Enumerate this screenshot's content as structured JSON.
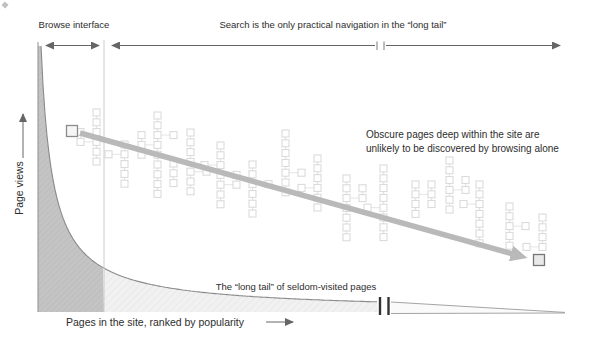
{
  "labels": {
    "browse": "Browse interface",
    "search": "Search is the only practical navigation in the “long tail”",
    "obscure_line1": "Obscure pages deep within the site are",
    "obscure_line2": "unlikely to be discovered by browsing alone",
    "long_tail": "The “long tail” of seldom-visited pages",
    "x_axis": "Pages in the site, ranked by popularity",
    "y_axis": "Page views"
  },
  "colors": {
    "head_fill": "#c4c4c4",
    "head_hatch": "#b8b8b8",
    "tail_fill": "#f1f1f1",
    "tail_hatch": "#e4e4e4",
    "curve_stroke": "#8a8a8a",
    "big_arrow": "#b9b9b9",
    "thin_arrow": "#666666",
    "tree_stroke": "#d8d8d8",
    "tree_line": "#e2e2e2",
    "square_stroke": "#8c8c8c",
    "text": "#2d2d2d"
  },
  "geometry": {
    "curve": {
      "x0": 30,
      "k": 2570,
      "p": 0.946,
      "base": 312,
      "xStart": 41,
      "xSplit": 104,
      "xEnd": 378
    },
    "wedge": {
      "x1": 391,
      "y_top": 302,
      "y_bottom": 313.5,
      "x2": 565,
      "y_tip": 312.4
    },
    "big_arrow": {
      "x1": 80,
      "y1": 133,
      "x2": 513,
      "y2": 254
    },
    "start_square": {
      "x": 66.5,
      "y": 125.5,
      "size": 11
    },
    "end_square": {
      "x": 533.5,
      "y": 254.5,
      "size": 11
    },
    "tree_square": 7,
    "tree_pitch": 9.8,
    "trees": [
      {
        "x": 93,
        "y": 109,
        "n": 6,
        "branches": [
          {
            "side": -1,
            "at": 3,
            "n": 2
          }
        ]
      },
      {
        "x": 121,
        "y": 141,
        "n": 5,
        "branches": [
          {
            "side": -1,
            "at": 1,
            "n": 1
          }
        ]
      },
      {
        "x": 154,
        "y": 112,
        "n": 9,
        "branches": [
          {
            "side": -1,
            "at": 3,
            "n": 3
          },
          {
            "side": 1,
            "at": 2,
            "n": 1
          }
        ]
      },
      {
        "x": 187,
        "y": 129,
        "n": 7,
        "branches": [
          {
            "side": 1,
            "at": 4,
            "n": 1
          }
        ]
      },
      {
        "x": 170,
        "y": 160,
        "n": 3,
        "branches": []
      },
      {
        "x": 217,
        "y": 142,
        "n": 7,
        "branches": [
          {
            "side": -1,
            "at": 2,
            "n": 1
          },
          {
            "side": 1,
            "at": 4,
            "n": 2
          }
        ]
      },
      {
        "x": 249,
        "y": 161,
        "n": 6,
        "branches": [
          {
            "side": 1,
            "at": 2,
            "n": 1
          }
        ]
      },
      {
        "x": 282,
        "y": 130,
        "n": 7,
        "branches": [
          {
            "side": 1,
            "at": 4,
            "n": 1
          }
        ]
      },
      {
        "x": 314,
        "y": 155,
        "n": 6,
        "branches": [
          {
            "side": -1,
            "at": 3,
            "n": 1
          }
        ]
      },
      {
        "x": 343,
        "y": 175,
        "n": 7,
        "branches": [
          {
            "side": 1,
            "at": 2,
            "n": 2
          }
        ]
      },
      {
        "x": 380,
        "y": 165,
        "n": 8,
        "branches": [
          {
            "side": -1,
            "at": 4,
            "n": 1
          }
        ]
      },
      {
        "x": 412,
        "y": 181,
        "n": 4,
        "branches": [
          {
            "side": 1,
            "at": 1,
            "n": 3
          }
        ]
      },
      {
        "x": 446,
        "y": 157,
        "n": 6,
        "branches": [
          {
            "side": 1,
            "at": 3,
            "n": 2
          }
        ]
      },
      {
        "x": 476,
        "y": 181,
        "n": 7,
        "branches": [
          {
            "side": -1,
            "at": 2,
            "n": 1
          }
        ]
      },
      {
        "x": 506,
        "y": 203,
        "n": 5,
        "branches": [
          {
            "side": 1,
            "at": 2,
            "n": 1
          }
        ]
      },
      {
        "x": 539,
        "y": 214,
        "n": 4,
        "branches": [
          {
            "side": -1,
            "at": 3,
            "n": 1
          }
        ]
      }
    ]
  },
  "chart_data": {
    "type": "area",
    "title": "",
    "xlabel": "Pages in the site, ranked by popularity",
    "ylabel": "Page views",
    "grid": false,
    "legend": false,
    "axis_break_x_px": 384,
    "series": [
      {
        "name": "Page views by popularity rank",
        "shape": "power-law decay (long tail)",
        "points_px": [
          [
            41,
            46
          ],
          [
            60,
            209
          ],
          [
            80,
            248
          ],
          [
            104,
            268
          ],
          [
            150,
            284
          ],
          [
            200,
            292
          ],
          [
            300,
            299
          ],
          [
            378,
            302
          ],
          [
            565,
            312
          ]
        ]
      }
    ],
    "regions": [
      {
        "label": "Browse interface",
        "x_px": [
          38,
          104
        ],
        "fill": "dark-gray"
      },
      {
        "label": "Search is the only practical navigation in the “long tail”",
        "x_px": [
          104,
          565
        ],
        "fill": "light-gray"
      }
    ],
    "annotations": [
      "Obscure pages deep within the site are unlikely to be discovered by browsing alone",
      "The “long tail” of seldom-visited pages"
    ]
  }
}
